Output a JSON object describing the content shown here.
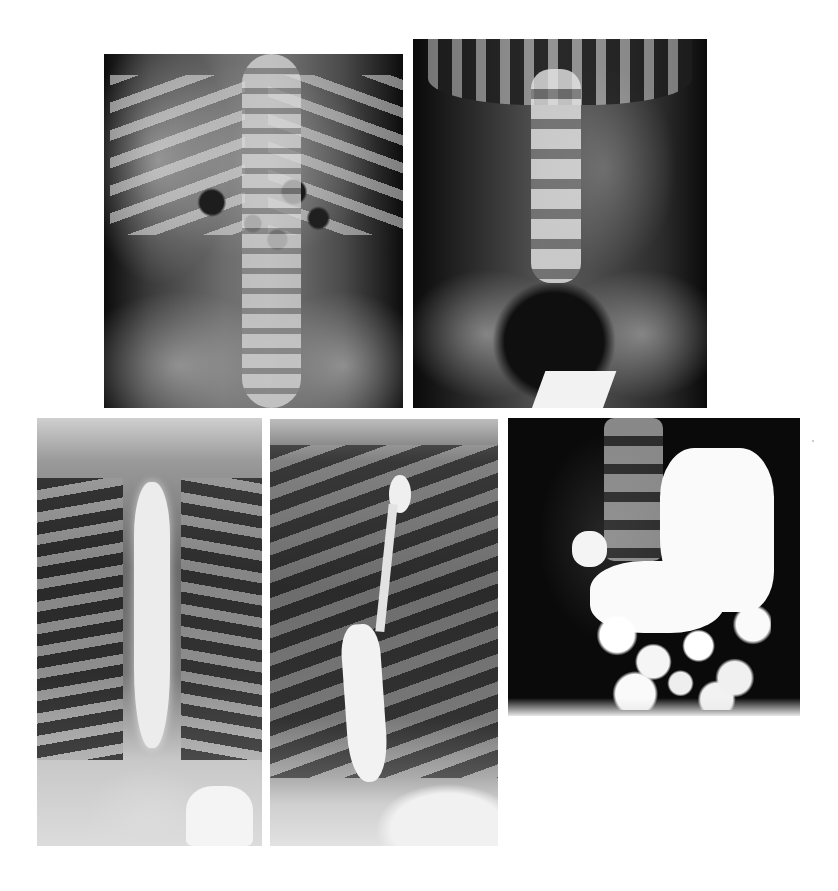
{
  "figure": {
    "type": "radiograph-composite",
    "background": "#ffffff",
    "panel_count": 5,
    "panels": [
      {
        "id": "p1",
        "subject": "abdominal radiograph, supine AP, pediatric, gas-filled bowel loops",
        "position": "top-left"
      },
      {
        "id": "p2",
        "subject": "abdominal radiograph AP including pelvis, lumbar spine",
        "position": "top-right"
      },
      {
        "id": "p3",
        "subject": "barium esophagram AP view, dilated esophagus",
        "position": "bottom-left"
      },
      {
        "id": "p4",
        "subject": "barium esophagram oblique view, tapered distal esophagus",
        "position": "bottom-middle"
      },
      {
        "id": "p5",
        "subject": "upper GI barium study, contrast-filled stomach and bowel",
        "position": "bottom-right"
      }
    ]
  }
}
